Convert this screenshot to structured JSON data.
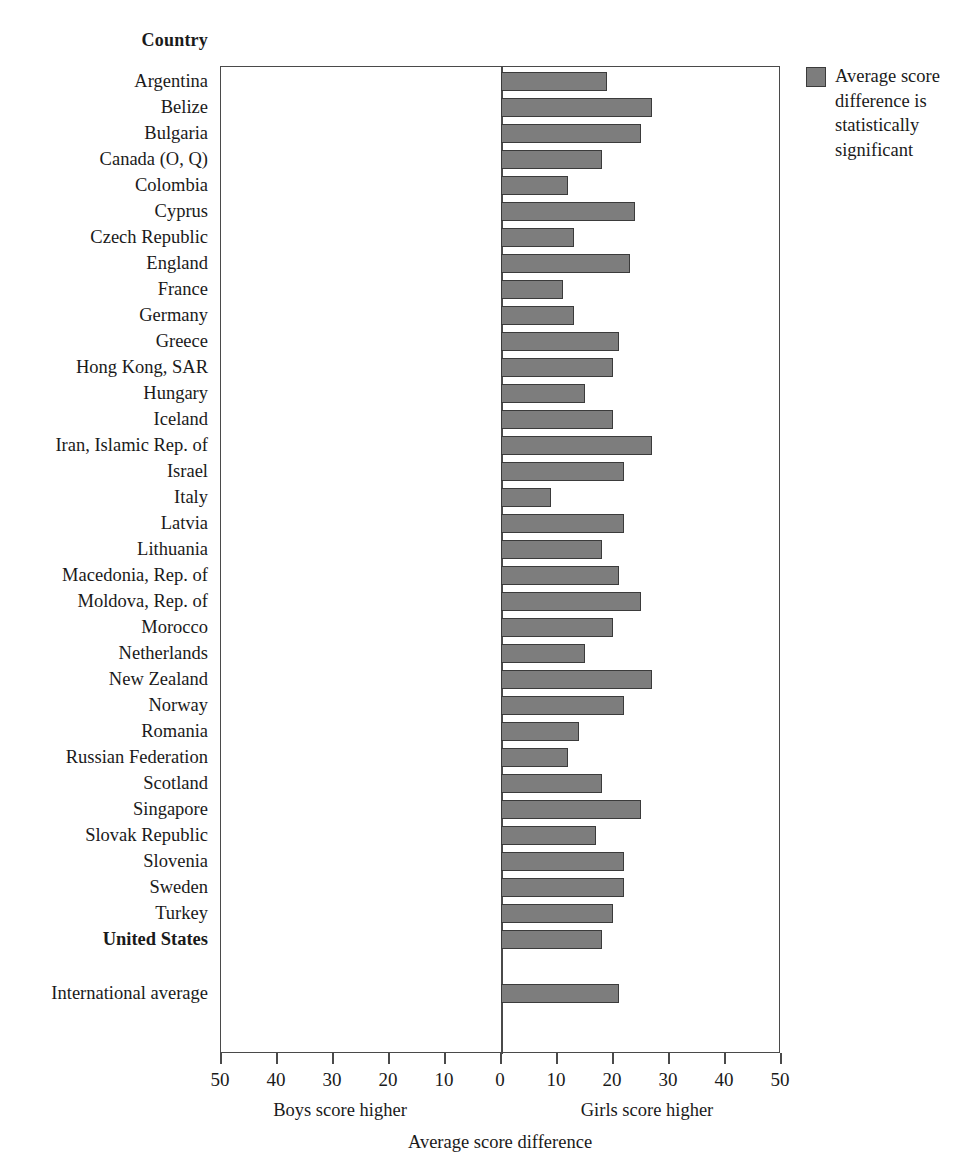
{
  "header": {
    "country_column_title": "Country"
  },
  "legend": {
    "swatch_color": "#7d7d7d",
    "label": "Average score difference is statistically significant"
  },
  "axis": {
    "title": "Average score difference",
    "left_caption": "Boys score higher",
    "right_caption": "Girls score higher",
    "tick_labels": [
      "50",
      "40",
      "30",
      "20",
      "10",
      "0",
      "10",
      "20",
      "30",
      "40",
      "50"
    ],
    "tick_values": [
      -50,
      -40,
      -30,
      -20,
      -10,
      0,
      10,
      20,
      30,
      40,
      50
    ]
  },
  "chart_data": {
    "type": "bar",
    "orientation": "horizontal",
    "title": "",
    "xlabel": "Average score difference",
    "ylabel": "Country",
    "xlim": [
      -50,
      50
    ],
    "xticks": [
      -50,
      -40,
      -30,
      -20,
      -10,
      0,
      10,
      20,
      30,
      40,
      50
    ],
    "xticklabels": [
      "50",
      "40",
      "30",
      "20",
      "10",
      "0",
      "10",
      "20",
      "30",
      "40",
      "50"
    ],
    "grid": false,
    "legend_position": "right",
    "legend_entries": [
      "Average score difference is statistically significant"
    ],
    "annotations": [
      "Boys score higher",
      "Girls score higher"
    ],
    "series_name": "Average score difference (girls minus boys)",
    "bar_color": "#7d7d7d",
    "bar_edge_color": "#3b3b3b",
    "categories": [
      "Argentina",
      "Belize",
      "Bulgaria",
      "Canada (O, Q)",
      "Colombia",
      "Cyprus",
      "Czech Republic",
      "England",
      "France",
      "Germany",
      "Greece",
      "Hong Kong, SAR",
      "Hungary",
      "Iceland",
      "Iran, Islamic Rep. of",
      "Israel",
      "Italy",
      "Latvia",
      "Lithuania",
      "Macedonia, Rep. of",
      "Moldova, Rep. of",
      "Morocco",
      "Netherlands",
      "New Zealand",
      "Norway",
      "Romania",
      "Russian Federation",
      "Scotland",
      "Singapore",
      "Slovak Republic",
      "Slovenia",
      "Sweden",
      "Turkey",
      "United States",
      "International average"
    ],
    "values": [
      19,
      27,
      25,
      18,
      12,
      24,
      13,
      23,
      11,
      13,
      21,
      20,
      15,
      20,
      27,
      22,
      9,
      22,
      18,
      21,
      25,
      20,
      15,
      27,
      22,
      14,
      12,
      18,
      25,
      17,
      22,
      22,
      20,
      18,
      21
    ],
    "bold_categories": [
      "United States"
    ],
    "separated_last_category": "International average"
  }
}
